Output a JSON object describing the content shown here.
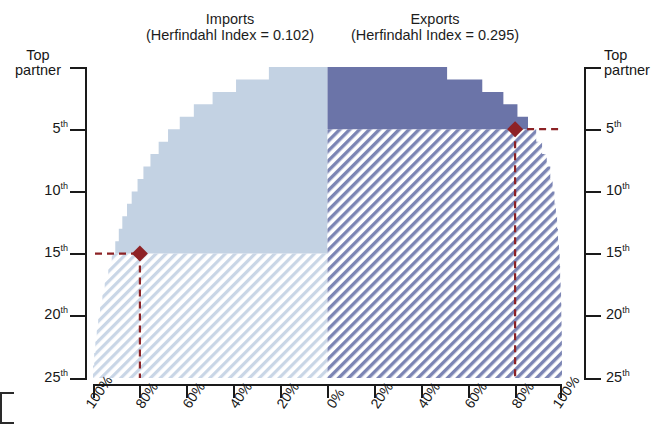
{
  "figure": {
    "type": "back-to-back-stepped-cumulative-area",
    "background": "#ffffff"
  },
  "panels": {
    "imports": {
      "name": "Imports",
      "title_line1": "Imports",
      "title_line2": "(Herfindahl Index = 0.102)",
      "herfindahl_index": 0.102,
      "fill_color": "#c3d2e3",
      "hatch_color": "#c9d6e6",
      "side": "left"
    },
    "exports": {
      "name": "Exports",
      "title_line1": "Exports",
      "title_line2": "(Herfindahl Index = 0.295)",
      "herfindahl_index": 0.295,
      "fill_color": "#6b74a8",
      "hatch_color": "#7c85b4",
      "side": "right"
    }
  },
  "axes": {
    "y_left": {
      "label_top_l1": "Top",
      "label_top_l2": "partner",
      "ticks": [
        "Top partner",
        "5",
        "10",
        "15",
        "20",
        "25"
      ],
      "tick_labels": [
        "Top partner",
        "5th",
        "10th",
        "15th",
        "20th",
        "25th"
      ],
      "ordinal_suffix": "th",
      "range": [
        1,
        25
      ]
    },
    "y_right": {
      "label_top_l1": "Top",
      "label_top_l2": "partner",
      "ticks": [
        "Top partner",
        "5",
        "10",
        "15",
        "20",
        "25"
      ],
      "tick_labels": [
        "Top partner",
        "5th",
        "10th",
        "15th",
        "20th",
        "25th"
      ],
      "ordinal_suffix": "th",
      "range": [
        1,
        25
      ]
    },
    "x": {
      "tick_labels": [
        "100%",
        "80%",
        "60%",
        "40%",
        "20%",
        "0%",
        "20%",
        "40%",
        "60%",
        "80%",
        "100%"
      ],
      "tick_values": [
        100,
        80,
        60,
        40,
        20,
        0,
        20,
        40,
        60,
        80,
        100
      ],
      "center_value": 0,
      "grid": false
    }
  },
  "markers": {
    "imports": {
      "label": "imports-threshold-marker",
      "rank": 15,
      "share_percent": 80,
      "color": "#8e2226",
      "shape": "diamond"
    },
    "exports": {
      "label": "exports-threshold-marker",
      "rank": 5,
      "share_percent": 80,
      "color": "#8e2226",
      "shape": "diamond"
    }
  },
  "chart_data": {
    "type": "area",
    "xlabel": "",
    "ylabel": "Top partner",
    "xlim": [
      -100,
      100
    ],
    "ylim": [
      1,
      25
    ],
    "grid": false,
    "legend_position": "none",
    "categories": [
      "Top partner",
      "2nd",
      "3rd",
      "4th",
      "5th",
      "6th",
      "7th",
      "8th",
      "9th",
      "10th",
      "11th",
      "12th",
      "13th",
      "14th",
      "15th",
      "16th",
      "17th",
      "18th",
      "19th",
      "20th",
      "21st",
      "22nd",
      "23rd",
      "24th",
      "25th"
    ],
    "ranks": [
      1,
      2,
      3,
      4,
      5,
      6,
      7,
      8,
      9,
      10,
      11,
      12,
      13,
      14,
      15,
      16,
      17,
      18,
      19,
      20,
      21,
      22,
      23,
      24,
      25
    ],
    "series": [
      {
        "name": "Imports",
        "herfindahl_index": 0.102,
        "color": "#c3d2e3",
        "axis_side": "left",
        "units": "cumulative percent of imports",
        "values": [
          25,
          39,
          49,
          57,
          63,
          68,
          72,
          75.5,
          78.5,
          81,
          83.5,
          85.5,
          87.5,
          89,
          90.5,
          92,
          93.5,
          95,
          96,
          97,
          97.8,
          98.4,
          99,
          99.5,
          100
        ],
        "threshold_rank": 15,
        "threshold_share": 80
      },
      {
        "name": "Exports",
        "herfindahl_index": 0.295,
        "color": "#6b74a8",
        "axis_side": "right",
        "units": "cumulative percent of exports",
        "values": [
          51,
          66,
          75,
          81,
          85.5,
          89,
          91.5,
          93.5,
          95,
          96,
          96.8,
          97.4,
          97.9,
          98.3,
          98.7,
          99,
          99.2,
          99.4,
          99.6,
          99.7,
          99.8,
          99.9,
          99.95,
          99.98,
          100
        ],
        "threshold_rank": 5,
        "threshold_share": 80
      }
    ],
    "annotations": [
      {
        "series": "Imports",
        "rank": 15,
        "share_percent": 80,
        "marker": "diamond",
        "color": "#8e2226"
      },
      {
        "series": "Exports",
        "rank": 5,
        "share_percent": 80,
        "marker": "diamond",
        "color": "#8e2226"
      }
    ]
  }
}
